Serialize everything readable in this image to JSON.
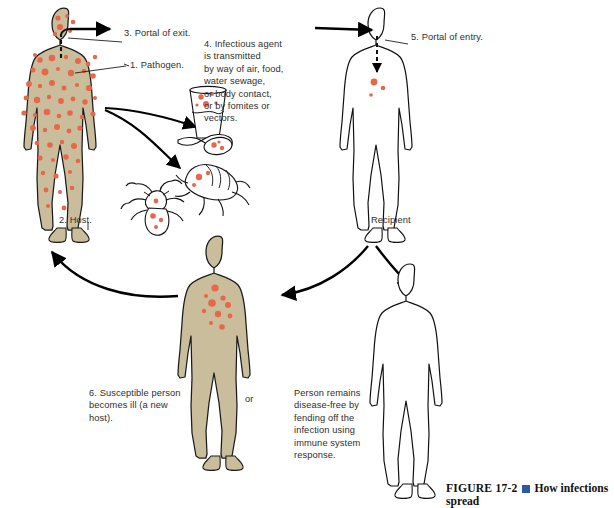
{
  "figure": {
    "number": "FIGURE 17-2",
    "bullet_color": "#2d5a9e",
    "title": "How infections spread"
  },
  "palette": {
    "skin": "#c9bd9b",
    "skin_stroke": "#1a1a1a",
    "pathogen": "#e8674a",
    "pathogen_light": "#ef8f76",
    "outline": "#111111",
    "arrow": "#000000",
    "text": "#2e2e2e",
    "accent_blue": "#2d5a9e",
    "background": "#ffffff"
  },
  "annotations": [
    {
      "id": "portal-of-exit",
      "text": "3. Portal of exit."
    },
    {
      "id": "pathogen",
      "text": "1. Pathogen."
    },
    {
      "id": "host",
      "text": "2. Host."
    },
    {
      "id": "transmission",
      "text": "4. Infectious agent\nis transmitted\nby way of air, food,\nwater sewage,\nor body contact,\nor by fomites or\nvectors."
    },
    {
      "id": "portal-of-entry",
      "text": "5. Portal of entry."
    },
    {
      "id": "recipient",
      "text": "Recipient"
    },
    {
      "id": "susceptible",
      "text": "6. Susceptible person\nbecomes ill (a new\nhost)."
    },
    {
      "id": "or-connector",
      "text": "or"
    },
    {
      "id": "disease-free",
      "text": "Person remains\ndisease-free by\nfending off the\ninfection using\nimmune system\nresponse."
    }
  ],
  "figures": [
    {
      "id": "host-figure",
      "state": "infected",
      "fill": "skin",
      "pathogen_count": "many"
    },
    {
      "id": "recipient-figure",
      "state": "newly-exposed",
      "fill": "white",
      "pathogen_count": "few"
    },
    {
      "id": "susceptible-figure",
      "state": "infected",
      "fill": "skin",
      "pathogen_count": "cluster"
    },
    {
      "id": "disease-free-figure",
      "state": "healthy",
      "fill": "white",
      "pathogen_count": "none"
    }
  ],
  "vectors": [
    {
      "id": "glass-of-water",
      "label": "water sewage"
    },
    {
      "id": "spoon",
      "label": "food"
    },
    {
      "id": "flea",
      "label": "vector"
    },
    {
      "id": "louse",
      "label": "vector"
    }
  ]
}
